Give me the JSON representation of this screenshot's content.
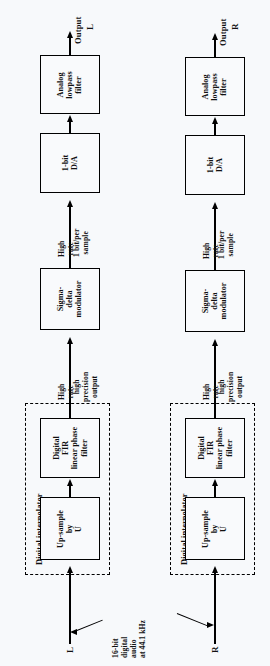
{
  "diagram": {
    "type": "block-diagram",
    "orientation": "rotated-90-ccw",
    "background_color": "#f7f9fb",
    "line_color": "#000000",
    "channels": [
      {
        "id": "left",
        "input_label": "L",
        "output_prefix": "Output",
        "output_label": "L",
        "group_label": "Digital interpolator",
        "blocks": [
          {
            "id": "upsample",
            "lines": [
              "Up-sample",
              "by",
              "U"
            ]
          },
          {
            "id": "fir",
            "lines": [
              "Digital",
              "FIR",
              "linear phase",
              "filter"
            ]
          },
          {
            "id": "sigma-delta",
            "lines": [
              "Sigma-",
              "delta",
              "modulator"
            ]
          },
          {
            "id": "dac",
            "lines": [
              "1-bit",
              "D/A"
            ]
          },
          {
            "id": "analog-lpf",
            "lines": [
              "Analog",
              "lowpass",
              "filter"
            ]
          }
        ],
        "annotations": [
          {
            "id": "fir-to-sigma",
            "left_lines": [
              "High",
              "rate"
            ],
            "right_lines": [
              "high",
              "precision",
              "output"
            ]
          },
          {
            "id": "sigma-to-dac",
            "left_lines": [
              "High",
              "rate"
            ],
            "right_lines": [
              "1 bit/per",
              "sample"
            ]
          }
        ]
      },
      {
        "id": "right",
        "input_label": "R",
        "output_prefix": "Output",
        "output_label": "R",
        "group_label": "Digital interpolator",
        "blocks": [
          {
            "id": "upsample",
            "lines": [
              "Up-sample",
              "by",
              "U"
            ]
          },
          {
            "id": "fir",
            "lines": [
              "Digital",
              "FIR",
              "linear phase",
              "filter"
            ]
          },
          {
            "id": "sigma-delta",
            "lines": [
              "Sigma-",
              "delta",
              "modulator"
            ]
          },
          {
            "id": "dac",
            "lines": [
              "1-bit",
              "D/A"
            ]
          },
          {
            "id": "analog-lpf",
            "lines": [
              "Analog",
              "lowpass",
              "filter"
            ]
          }
        ],
        "annotations": [
          {
            "id": "fir-to-sigma",
            "left_lines": [
              "High",
              "rate"
            ],
            "right_lines": [
              "high",
              "precision",
              "output"
            ]
          },
          {
            "id": "sigma-to-dac",
            "left_lines": [
              "High",
              "rate"
            ],
            "right_lines": [
              "1 bit/per",
              "sample"
            ]
          }
        ]
      }
    ],
    "input_source": {
      "lines": [
        "16-bit",
        "digital",
        "audio",
        "at 44.1 kHz"
      ]
    }
  }
}
